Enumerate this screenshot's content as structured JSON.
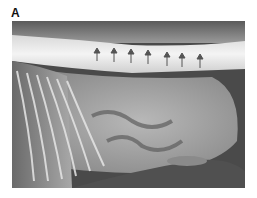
{
  "figure": {
    "panel_label": "A",
    "image_description": "Lateral abdominal radiograph with arrows along the spine"
  }
}
